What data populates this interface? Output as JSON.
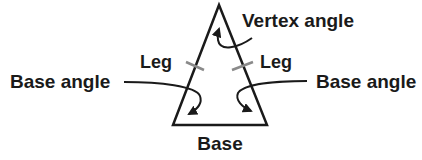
{
  "diagram": {
    "colors": {
      "stroke": "#1a1a1a",
      "tick": "#8a8a8a",
      "background": "#ffffff"
    },
    "labels": {
      "vertex_angle": "Vertex angle",
      "leg_left": "Leg",
      "leg_right": "Leg",
      "base_angle_left": "Base angle",
      "base_angle_right": "Base angle",
      "base": "Base"
    }
  }
}
